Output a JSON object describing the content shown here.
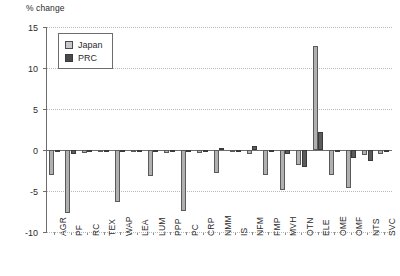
{
  "chart_data": {
    "type": "bar",
    "title": "",
    "ylabel": "% change",
    "xlabel": "",
    "ylim": [
      -10,
      15
    ],
    "yticks": [
      15,
      10,
      5,
      0,
      -5,
      -10
    ],
    "ytick_labels": [
      "15",
      "10",
      "5",
      "0",
      "-5",
      "-10"
    ],
    "grid": true,
    "legend_position": "upper-left-inside",
    "categories": [
      "AGR",
      "PF",
      "RC",
      "TEX",
      "WAP",
      "LEA",
      "LUM",
      "PPP",
      "PC",
      "CRP",
      "NMM",
      "IS",
      "NFM",
      "FMP",
      "MVH",
      "OTN",
      "ELE",
      "OME",
      "OMF",
      "NTS",
      "SVC"
    ],
    "series": [
      {
        "name": "Japan",
        "color": "#b0b0b0",
        "values": [
          -3.1,
          -7.7,
          -0.4,
          -0.2,
          -6.3,
          -0.3,
          -3.2,
          -0.4,
          -7.4,
          -0.4,
          -2.8,
          -0.3,
          -0.5,
          -3.0,
          -4.9,
          -1.8,
          12.7,
          -3.0,
          -4.6,
          -0.6,
          -0.5
        ]
      },
      {
        "name": "PRC",
        "color": "#5c5c5c",
        "values": [
          -0.3,
          -0.5,
          -0.2,
          -0.3,
          -0.3,
          -0.2,
          -0.2,
          -0.2,
          -0.3,
          -0.2,
          0.3,
          -0.2,
          0.5,
          -0.3,
          -0.5,
          -2.1,
          2.2,
          -0.2,
          -1.0,
          -1.4,
          -0.2
        ]
      }
    ]
  },
  "legend": {
    "items": [
      {
        "label": "Japan"
      },
      {
        "label": "PRC"
      }
    ]
  }
}
